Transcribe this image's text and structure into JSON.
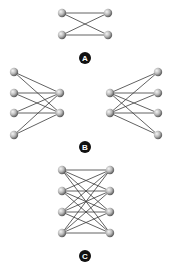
{
  "canvas": {
    "width": 169,
    "height": 270,
    "background": "#ffffff"
  },
  "colors": {
    "edge": "#3a3a3a",
    "node_light": "#f2f2f2",
    "node_mid": "#b8b8b8",
    "node_dark": "#6a6a6a",
    "label_bg": "#111111",
    "label_fg": "#ffffff"
  },
  "figures": [
    {
      "id": "A",
      "label": "A",
      "label_pos": [
        85,
        58
      ],
      "nodes": [
        [
          62,
          13
        ],
        [
          62,
          35
        ],
        [
          108,
          13
        ],
        [
          108,
          35
        ]
      ],
      "edges": [
        [
          0,
          2
        ],
        [
          1,
          3
        ],
        [
          0,
          3
        ],
        [
          1,
          2
        ]
      ]
    },
    {
      "id": "B",
      "label": "B",
      "label_pos": [
        85,
        147
      ],
      "subgraphs": [
        {
          "id": "B-left",
          "nodes": [
            [
              14,
              72
            ],
            [
              14,
              93
            ],
            [
              14,
              113
            ],
            [
              14,
              135
            ],
            [
              60,
              93
            ],
            [
              60,
              113
            ]
          ],
          "edges": [
            [
              0,
              4
            ],
            [
              0,
              5
            ],
            [
              1,
              4
            ],
            [
              1,
              5
            ],
            [
              2,
              4
            ],
            [
              2,
              5
            ],
            [
              3,
              4
            ],
            [
              3,
              5
            ]
          ]
        },
        {
          "id": "B-right",
          "nodes": [
            [
              110,
              93
            ],
            [
              110,
              113
            ],
            [
              158,
              72
            ],
            [
              158,
              93
            ],
            [
              158,
              113
            ],
            [
              158,
              135
            ]
          ],
          "edges": [
            [
              0,
              2
            ],
            [
              0,
              3
            ],
            [
              0,
              4
            ],
            [
              0,
              5
            ],
            [
              1,
              2
            ],
            [
              1,
              3
            ],
            [
              1,
              4
            ],
            [
              1,
              5
            ]
          ]
        }
      ]
    },
    {
      "id": "C",
      "label": "C",
      "label_pos": [
        85,
        256
      ],
      "nodes": [
        [
          62,
          170
        ],
        [
          62,
          191
        ],
        [
          62,
          212
        ],
        [
          62,
          233
        ],
        [
          110,
          170
        ],
        [
          110,
          191
        ],
        [
          110,
          212
        ],
        [
          110,
          233
        ]
      ],
      "edges": [
        [
          0,
          4
        ],
        [
          0,
          5
        ],
        [
          0,
          6
        ],
        [
          0,
          7
        ],
        [
          1,
          4
        ],
        [
          1,
          5
        ],
        [
          1,
          6
        ],
        [
          1,
          7
        ],
        [
          2,
          4
        ],
        [
          2,
          5
        ],
        [
          2,
          6
        ],
        [
          2,
          7
        ],
        [
          3,
          4
        ],
        [
          3,
          5
        ],
        [
          3,
          6
        ],
        [
          3,
          7
        ]
      ]
    }
  ]
}
